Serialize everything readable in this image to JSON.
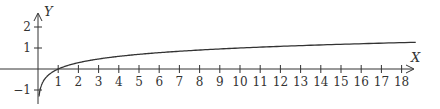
{
  "chart_data": {
    "type": "line",
    "title": "",
    "xlabel": "X",
    "ylabel": "Y",
    "function": "y = log10(x)",
    "xlim": [
      0,
      18.7
    ],
    "ylim": [
      -1.3,
      2.6
    ],
    "grid": false,
    "legend": null,
    "x_ticks": [
      1,
      2,
      3,
      4,
      5,
      6,
      7,
      8,
      9,
      10,
      11,
      12,
      13,
      14,
      15,
      16,
      17,
      18
    ],
    "y_ticks": [
      -1,
      1,
      2
    ],
    "series": [
      {
        "name": "curve",
        "x": [
          0.05,
          0.1,
          0.2,
          0.5,
          1,
          2,
          3,
          4,
          5,
          6,
          8,
          10,
          12,
          14,
          16,
          18,
          18.7
        ],
        "values": [
          -1.3,
          -1,
          -0.7,
          -0.3,
          0,
          0.3,
          0.48,
          0.6,
          0.7,
          0.78,
          0.9,
          1,
          1.08,
          1.15,
          1.2,
          1.26,
          1.27
        ]
      }
    ],
    "colors": {
      "axis": "#333333",
      "curve": "#333333"
    }
  }
}
